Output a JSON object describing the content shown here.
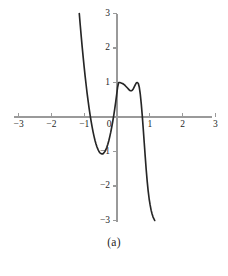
{
  "figure": {
    "caption": "(a)",
    "background_color": "#ffffff"
  },
  "chart_data": {
    "type": "line",
    "title": "",
    "subtitle": "",
    "xlabel": "",
    "ylabel": "",
    "xlim": [
      -3,
      3
    ],
    "ylim": [
      -3,
      3
    ],
    "grid": false,
    "legend": null,
    "axis_color": "#9a9a9a",
    "curve_color": "#262626",
    "xticks": [
      -3,
      -2,
      -1,
      0,
      1,
      2,
      3
    ],
    "xtick_labels": [
      "−3",
      "−2",
      "−1",
      "0",
      "1",
      "2",
      "3"
    ],
    "yticks": [
      -3,
      -2,
      -1,
      0,
      1,
      2,
      3
    ],
    "ytick_labels": [
      "−3",
      "−2",
      "−1",
      "",
      "1",
      "2",
      "3"
    ],
    "ytick_labels_shown": [
      "3",
      "2",
      "1",
      "−1",
      "−2",
      "−3"
    ],
    "annotations": [],
    "features": {
      "zero_crossings": [
        -0.87,
        0,
        0.87
      ],
      "local_minimum": {
        "x": -0.72,
        "y": -1.0
      },
      "local_maximum": {
        "x": 0.72,
        "y": 1.0
      },
      "curve_start": {
        "x": -1.15,
        "y": 3.0
      },
      "curve_end": {
        "x": 1.15,
        "y": -3.0
      },
      "shape": "cubic-like descending curve with one local minimum and one local maximum"
    },
    "series": [
      {
        "name": "curve",
        "x": [
          -1.15,
          -1.12,
          -1.09,
          -1.06,
          -1.03,
          -1.0,
          -0.97,
          -0.94,
          -0.91,
          -0.88,
          -0.85,
          -0.82,
          -0.79,
          -0.76,
          -0.73,
          -0.7,
          -0.67,
          -0.64,
          -0.61,
          -0.58,
          -0.55,
          -0.52,
          -0.49,
          -0.46,
          -0.43,
          -0.4,
          -0.37,
          -0.34,
          -0.31,
          -0.28,
          -0.25,
          -0.22,
          -0.19,
          -0.16,
          -0.13,
          -0.1,
          -0.07,
          -0.04,
          -0.01,
          0.02,
          0.05,
          0.08,
          0.11,
          0.14,
          0.17,
          0.2,
          0.23,
          0.26,
          0.29,
          0.32,
          0.35,
          0.38,
          0.41,
          0.44,
          0.47,
          0.5,
          0.53,
          0.56,
          0.59,
          0.62,
          0.65,
          0.68,
          0.71,
          0.74,
          0.77,
          0.8,
          0.83,
          0.86,
          0.89,
          0.92,
          0.95,
          0.98,
          1.01,
          1.04,
          1.07,
          1.1,
          1.15
        ],
        "y": [
          3.0,
          2.66,
          2.33,
          2.02,
          1.72,
          1.44,
          1.17,
          0.92,
          0.68,
          0.46,
          0.25,
          0.06,
          -0.12,
          -0.28,
          -0.43,
          -0.56,
          -0.68,
          -0.78,
          -0.87,
          -0.94,
          -1.0,
          -1.04,
          -1.06,
          -1.07,
          -1.07,
          -1.04,
          -1.0,
          -0.95,
          -0.88,
          -0.79,
          -0.69,
          -0.57,
          -0.44,
          -0.29,
          -0.13,
          0.04,
          0.23,
          0.43,
          0.65,
          0.87,
          1.0,
          1.0,
          0.99,
          0.98,
          0.97,
          0.95,
          0.93,
          0.9,
          0.87,
          0.84,
          0.81,
          0.78,
          0.76,
          0.76,
          0.78,
          0.82,
          0.88,
          0.94,
          0.99,
          1.0,
          0.97,
          0.86,
          0.66,
          0.38,
          0.04,
          -0.34,
          -0.74,
          -1.14,
          -1.52,
          -1.86,
          -2.14,
          -2.37,
          -2.55,
          -2.7,
          -2.81,
          -2.9,
          -3.0
        ]
      }
    ]
  }
}
